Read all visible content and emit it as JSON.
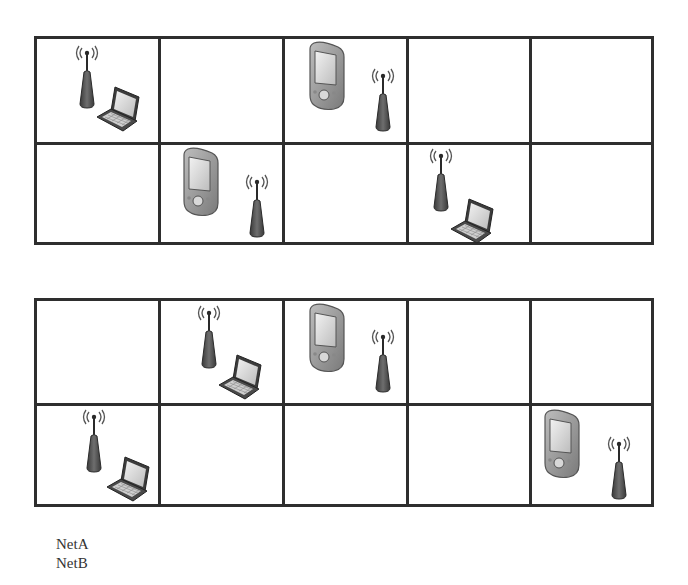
{
  "diagram": {
    "type": "cell-placement-grids",
    "grid_rows": 2,
    "grid_cols": 5,
    "colors": {
      "grid_line": "#2e2e2e",
      "device_dark": "#4a4a4a",
      "device_mid": "#8a8a8a",
      "device_light": "#d4d4d4",
      "background": "#ffffff"
    },
    "grids": [
      {
        "id": "grid-top",
        "cells": [
          {
            "row": 0,
            "col": 0,
            "devices": [
              "antenna",
              "laptop"
            ]
          },
          {
            "row": 0,
            "col": 1,
            "devices": []
          },
          {
            "row": 0,
            "col": 2,
            "devices": [
              "pda",
              "antenna"
            ]
          },
          {
            "row": 0,
            "col": 3,
            "devices": []
          },
          {
            "row": 0,
            "col": 4,
            "devices": []
          },
          {
            "row": 1,
            "col": 0,
            "devices": []
          },
          {
            "row": 1,
            "col": 1,
            "devices": [
              "pda",
              "antenna"
            ]
          },
          {
            "row": 1,
            "col": 2,
            "devices": []
          },
          {
            "row": 1,
            "col": 3,
            "devices": [
              "antenna",
              "laptop"
            ]
          },
          {
            "row": 1,
            "col": 4,
            "devices": []
          }
        ]
      },
      {
        "id": "grid-bottom",
        "cells": [
          {
            "row": 0,
            "col": 0,
            "devices": []
          },
          {
            "row": 0,
            "col": 1,
            "devices": [
              "antenna",
              "laptop"
            ]
          },
          {
            "row": 0,
            "col": 2,
            "devices": [
              "pda",
              "antenna"
            ]
          },
          {
            "row": 0,
            "col": 3,
            "devices": []
          },
          {
            "row": 0,
            "col": 4,
            "devices": []
          },
          {
            "row": 1,
            "col": 0,
            "devices": [
              "antenna",
              "laptop"
            ]
          },
          {
            "row": 1,
            "col": 1,
            "devices": []
          },
          {
            "row": 1,
            "col": 2,
            "devices": []
          },
          {
            "row": 1,
            "col": 3,
            "devices": []
          },
          {
            "row": 1,
            "col": 4,
            "devices": [
              "pda",
              "antenna"
            ]
          }
        ]
      }
    ],
    "legend": {
      "items": [
        {
          "label": "NetA"
        },
        {
          "label": "NetB"
        }
      ]
    }
  }
}
